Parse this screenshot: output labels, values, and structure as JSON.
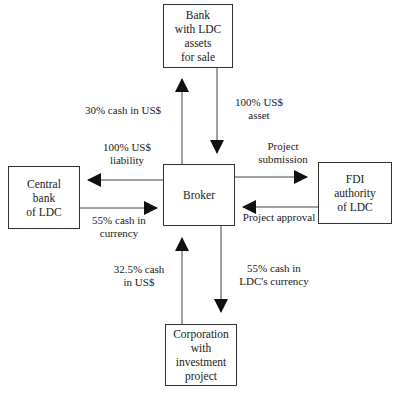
{
  "nodes": {
    "bank": "Bank\nwith LDC\nassets\nfor sale",
    "central_bank": "Central\nbank\nof LDC",
    "broker": "Broker",
    "fdi": "FDI\nauthority\nof LDC",
    "corporation": "Corporation\nwith\ninvestment\nproject"
  },
  "edges": {
    "broker_to_bank": "30% cash in US$",
    "bank_to_broker": "100% US$\nasset",
    "broker_to_central": "100% US$\nliability",
    "central_to_broker": "55% cash in\ncurrency",
    "broker_to_fdi": "Project\nsubmission",
    "fdi_to_broker": "Project approval",
    "corp_to_broker": "32.5% cash\nin US$",
    "broker_to_corp": "55% cash in\nLDC's currency"
  }
}
